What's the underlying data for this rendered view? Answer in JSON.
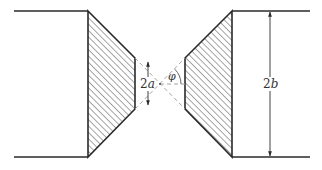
{
  "figure": {
    "colors": {
      "line": "#2a2a2a",
      "hatch": "#3a3a3a",
      "dashed": "#9a9a9a",
      "background": "#ffffff"
    },
    "labels": {
      "inner_width_coef": "2",
      "inner_width_var": "a",
      "outer_width_coef": "2",
      "outer_width_var": "b",
      "angle": "φ"
    }
  }
}
